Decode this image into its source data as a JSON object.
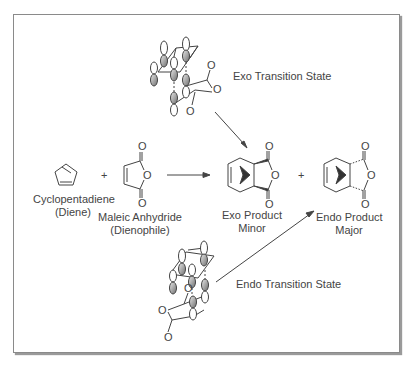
{
  "reactants": [
    {
      "name": "Cyclopentadiene",
      "role": "(Diene)"
    },
    {
      "name": "Maleic Anhydride",
      "role": "(Dienophile)"
    }
  ],
  "plus_sign": "+",
  "products": [
    {
      "name": "Exo Product",
      "yield": "Minor"
    },
    {
      "name": "Endo Product",
      "yield": "Major"
    }
  ],
  "transition_states": {
    "exo": "Exo Transition State",
    "endo": "Endo Transition State"
  },
  "atoms": {
    "oxygen": "O"
  },
  "colors": {
    "line": "#444444",
    "frame": "#8a8a8a",
    "lobe_shaded": "#9a9a9a"
  }
}
